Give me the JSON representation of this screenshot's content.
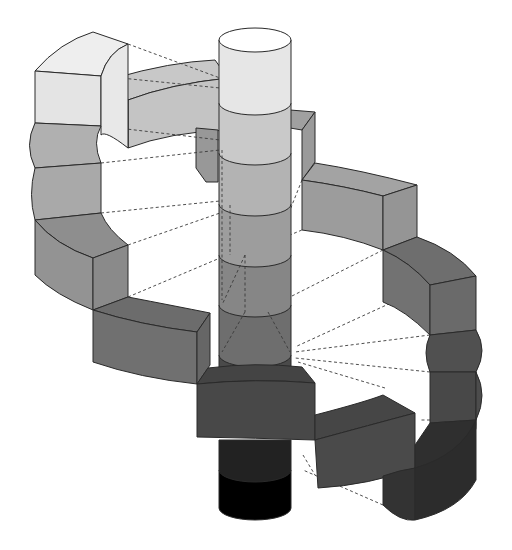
{
  "diagram": {
    "title": "",
    "labels": [],
    "colors": {
      "background": "#ffffff",
      "outline": "#2a2a2a",
      "dashed_connector": "#3a3a3a",
      "cylinder_segments": [
        "#ffffff",
        "#e6e6e6",
        "#c9c9c9",
        "#b3b3b3",
        "#9d9d9d",
        "#868686",
        "#6e6e6e",
        "#4a4a4a",
        "#1a1a1a",
        "#000000"
      ],
      "block_steps": [
        "#e4e4e4",
        "#bdbdbd",
        "#a8a8a8",
        "#9a9a9a",
        "#8c8c8c",
        "#7b7b7b",
        "#6d6d6d",
        "#5e5e5e",
        "#505050",
        "#464646",
        "#3e3e3e",
        "#333333"
      ]
    },
    "cylinder": {
      "segment_count": 10
    },
    "helix": {
      "block_count": 12,
      "turns": 1.5
    }
  }
}
